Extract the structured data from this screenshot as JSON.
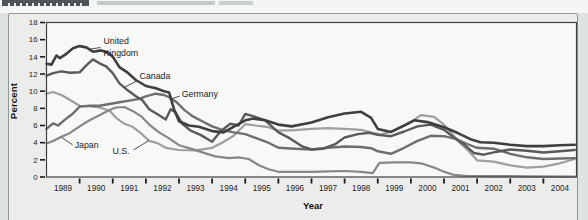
{
  "chart_data": {
    "type": "line",
    "xlabel": "Year",
    "ylabel": "Percent",
    "xlim": [
      1989,
      2005
    ],
    "ylim": [
      0,
      18
    ],
    "y_ticks": [
      0,
      2,
      4,
      6,
      8,
      10,
      12,
      14,
      16,
      18
    ],
    "x_tick_labels": [
      "1989",
      "1990",
      "1991",
      "1992",
      "1993",
      "1994",
      "1995",
      "1996",
      "1997",
      "1998",
      "1999",
      "2000",
      "2001",
      "2002",
      "2003",
      "2004"
    ],
    "grid": false,
    "legend": "inline-labels",
    "colors": {
      "frame": "#3f3f3f",
      "tick": "#1a1a1a",
      "text": "#1c1c1c",
      "plot_bg": "#f8f8f6",
      "leader": "#3c3c3c"
    },
    "series": [
      {
        "name": "U.S.",
        "color": "#9e9e9e",
        "width": 2.2,
        "points": [
          [
            1989.0,
            9.7
          ],
          [
            1989.2,
            9.9
          ],
          [
            1989.45,
            9.55
          ],
          [
            1989.7,
            9.0
          ],
          [
            1990.0,
            8.3
          ],
          [
            1990.3,
            8.25
          ],
          [
            1990.6,
            8.1
          ],
          [
            1990.9,
            7.75
          ],
          [
            1991.1,
            6.9
          ],
          [
            1991.35,
            6.2
          ],
          [
            1991.6,
            5.85
          ],
          [
            1991.85,
            5.1
          ],
          [
            1992.1,
            4.2
          ],
          [
            1992.35,
            3.95
          ],
          [
            1992.6,
            3.4
          ],
          [
            1993.0,
            3.15
          ],
          [
            1993.5,
            3.1
          ],
          [
            1994.0,
            3.4
          ],
          [
            1994.3,
            4.0
          ],
          [
            1994.65,
            4.8
          ],
          [
            1995.0,
            6.15
          ],
          [
            1995.3,
            6.0
          ],
          [
            1995.65,
            5.85
          ],
          [
            1996.0,
            5.4
          ],
          [
            1996.5,
            5.45
          ],
          [
            1997.0,
            5.6
          ],
          [
            1997.5,
            5.7
          ],
          [
            1998.0,
            5.6
          ],
          [
            1998.5,
            5.5
          ],
          [
            1998.85,
            5.15
          ],
          [
            1999.1,
            4.95
          ],
          [
            1999.5,
            5.4
          ],
          [
            2000.0,
            6.4
          ],
          [
            2000.3,
            7.2
          ],
          [
            2000.7,
            7.0
          ],
          [
            2001.0,
            6.1
          ],
          [
            2001.25,
            5.0
          ],
          [
            2001.5,
            3.9
          ],
          [
            2001.75,
            3.0
          ],
          [
            2002.0,
            1.95
          ],
          [
            2002.5,
            1.8
          ],
          [
            2003.0,
            1.35
          ],
          [
            2003.5,
            1.1
          ],
          [
            2004.0,
            1.2
          ],
          [
            2004.5,
            1.6
          ],
          [
            2004.95,
            2.1
          ]
        ]
      },
      {
        "name": "Japan",
        "color": "#878787",
        "width": 2.2,
        "points": [
          [
            1989.0,
            3.9
          ],
          [
            1989.2,
            4.2
          ],
          [
            1989.45,
            4.7
          ],
          [
            1989.7,
            5.1
          ],
          [
            1990.0,
            5.9
          ],
          [
            1990.3,
            6.6
          ],
          [
            1990.6,
            7.2
          ],
          [
            1990.9,
            7.8
          ],
          [
            1991.1,
            8.1
          ],
          [
            1991.35,
            8.15
          ],
          [
            1991.6,
            7.7
          ],
          [
            1991.85,
            7.1
          ],
          [
            1992.1,
            6.1
          ],
          [
            1992.4,
            5.2
          ],
          [
            1992.7,
            4.5
          ],
          [
            1993.0,
            3.7
          ],
          [
            1993.4,
            3.25
          ],
          [
            1993.8,
            2.75
          ],
          [
            1994.1,
            2.4
          ],
          [
            1994.5,
            2.2
          ],
          [
            1994.8,
            2.3
          ],
          [
            1995.1,
            2.1
          ],
          [
            1995.4,
            1.4
          ],
          [
            1995.7,
            0.9
          ],
          [
            1996.0,
            0.6
          ],
          [
            1996.5,
            0.6
          ],
          [
            1997.0,
            0.6
          ],
          [
            1997.5,
            0.65
          ],
          [
            1998.0,
            0.7
          ],
          [
            1998.5,
            0.6
          ],
          [
            1998.85,
            0.45
          ],
          [
            1999.05,
            1.65
          ],
          [
            1999.5,
            1.7
          ],
          [
            2000.0,
            1.7
          ],
          [
            2000.35,
            1.55
          ],
          [
            2000.7,
            1.1
          ],
          [
            2001.0,
            0.6
          ],
          [
            2001.3,
            0.25
          ],
          [
            2001.7,
            0.12
          ],
          [
            2002.5,
            0.1
          ],
          [
            2003.5,
            0.08
          ],
          [
            2004.95,
            0.05
          ]
        ]
      },
      {
        "name": "Germany",
        "color": "#6e6e6e",
        "width": 2.4,
        "points": [
          [
            1989.0,
            5.6
          ],
          [
            1989.2,
            6.25
          ],
          [
            1989.35,
            6.0
          ],
          [
            1989.55,
            6.65
          ],
          [
            1989.8,
            7.4
          ],
          [
            1990.0,
            8.2
          ],
          [
            1990.3,
            8.3
          ],
          [
            1990.6,
            8.3
          ],
          [
            1990.9,
            8.5
          ],
          [
            1991.2,
            8.7
          ],
          [
            1991.5,
            8.9
          ],
          [
            1991.8,
            9.1
          ],
          [
            1992.0,
            9.4
          ],
          [
            1992.3,
            9.7
          ],
          [
            1992.55,
            9.55
          ],
          [
            1992.75,
            9.2
          ],
          [
            1992.95,
            8.65
          ],
          [
            1993.15,
            7.85
          ],
          [
            1993.4,
            7.1
          ],
          [
            1993.7,
            6.5
          ],
          [
            1994.0,
            5.9
          ],
          [
            1994.3,
            5.5
          ],
          [
            1994.65,
            5.2
          ],
          [
            1995.0,
            5.0
          ],
          [
            1995.35,
            4.5
          ],
          [
            1995.7,
            4.0
          ],
          [
            1996.0,
            3.4
          ],
          [
            1996.5,
            3.3
          ],
          [
            1997.0,
            3.2
          ],
          [
            1997.5,
            3.4
          ],
          [
            1998.0,
            3.55
          ],
          [
            1998.5,
            3.5
          ],
          [
            1998.8,
            3.35
          ],
          [
            1999.0,
            3.0
          ],
          [
            1999.4,
            2.7
          ],
          [
            1999.8,
            3.4
          ],
          [
            2000.2,
            4.2
          ],
          [
            2000.6,
            4.8
          ],
          [
            2001.0,
            4.75
          ],
          [
            2001.35,
            4.45
          ],
          [
            2001.7,
            3.85
          ],
          [
            2002.0,
            3.4
          ],
          [
            2002.5,
            3.3
          ],
          [
            2003.0,
            2.7
          ],
          [
            2003.5,
            2.3
          ],
          [
            2004.0,
            2.1
          ],
          [
            2004.5,
            2.15
          ],
          [
            2004.95,
            2.2
          ]
        ]
      },
      {
        "name": "Canada",
        "color": "#5a5a5a",
        "width": 2.4,
        "points": [
          [
            1989.0,
            11.8
          ],
          [
            1989.2,
            12.1
          ],
          [
            1989.45,
            12.3
          ],
          [
            1989.7,
            12.15
          ],
          [
            1990.0,
            12.2
          ],
          [
            1990.2,
            13.0
          ],
          [
            1990.4,
            13.7
          ],
          [
            1990.6,
            13.25
          ],
          [
            1990.8,
            12.9
          ],
          [
            1991.0,
            12.1
          ],
          [
            1991.2,
            10.9
          ],
          [
            1991.45,
            10.1
          ],
          [
            1991.7,
            9.4
          ],
          [
            1991.9,
            8.9
          ],
          [
            1992.1,
            7.9
          ],
          [
            1992.35,
            7.3
          ],
          [
            1992.6,
            6.7
          ],
          [
            1992.75,
            7.9
          ],
          [
            1992.9,
            7.5
          ],
          [
            1993.1,
            6.2
          ],
          [
            1993.35,
            5.4
          ],
          [
            1993.65,
            4.9
          ],
          [
            1994.0,
            4.1
          ],
          [
            1994.25,
            5.3
          ],
          [
            1994.55,
            6.2
          ],
          [
            1994.8,
            6.0
          ],
          [
            1995.0,
            7.35
          ],
          [
            1995.3,
            7.0
          ],
          [
            1995.6,
            6.6
          ],
          [
            1996.0,
            5.2
          ],
          [
            1996.35,
            4.5
          ],
          [
            1996.7,
            3.6
          ],
          [
            1997.0,
            3.2
          ],
          [
            1997.35,
            3.3
          ],
          [
            1997.7,
            3.8
          ],
          [
            1998.0,
            4.6
          ],
          [
            1998.4,
            5.0
          ],
          [
            1998.75,
            5.15
          ],
          [
            1999.0,
            4.9
          ],
          [
            1999.4,
            4.75
          ],
          [
            1999.8,
            5.3
          ],
          [
            2000.2,
            5.9
          ],
          [
            2000.6,
            6.1
          ],
          [
            2001.0,
            5.5
          ],
          [
            2001.3,
            4.6
          ],
          [
            2001.6,
            3.8
          ],
          [
            2001.9,
            2.8
          ],
          [
            2002.2,
            2.6
          ],
          [
            2002.6,
            2.95
          ],
          [
            2003.0,
            3.2
          ],
          [
            2003.5,
            3.05
          ],
          [
            2004.0,
            2.85
          ],
          [
            2004.5,
            3.0
          ],
          [
            2004.95,
            3.15
          ]
        ]
      },
      {
        "name": "United Kingdom",
        "color": "#3f3f3f",
        "width": 2.6,
        "points": [
          [
            1989.0,
            13.2
          ],
          [
            1989.15,
            13.1
          ],
          [
            1989.3,
            14.15
          ],
          [
            1989.4,
            13.85
          ],
          [
            1989.6,
            14.35
          ],
          [
            1989.8,
            15.0
          ],
          [
            1990.0,
            15.25
          ],
          [
            1990.2,
            15.1
          ],
          [
            1990.4,
            14.6
          ],
          [
            1990.65,
            14.75
          ],
          [
            1990.85,
            14.5
          ],
          [
            1991.0,
            14.0
          ],
          [
            1991.2,
            12.8
          ],
          [
            1991.45,
            12.15
          ],
          [
            1991.7,
            11.3
          ],
          [
            1992.0,
            10.6
          ],
          [
            1992.3,
            10.35
          ],
          [
            1992.55,
            10.0
          ],
          [
            1992.7,
            9.85
          ],
          [
            1992.85,
            7.9
          ],
          [
            1993.0,
            6.5
          ],
          [
            1993.3,
            6.0
          ],
          [
            1993.6,
            5.85
          ],
          [
            1994.0,
            5.35
          ],
          [
            1994.35,
            5.2
          ],
          [
            1994.7,
            5.95
          ],
          [
            1995.0,
            6.6
          ],
          [
            1995.25,
            6.8
          ],
          [
            1995.6,
            6.6
          ],
          [
            1996.0,
            6.1
          ],
          [
            1996.4,
            5.9
          ],
          [
            1997.0,
            6.35
          ],
          [
            1997.5,
            6.95
          ],
          [
            1998.0,
            7.4
          ],
          [
            1998.5,
            7.6
          ],
          [
            1998.8,
            6.9
          ],
          [
            1999.0,
            5.6
          ],
          [
            1999.4,
            5.25
          ],
          [
            1999.8,
            6.0
          ],
          [
            2000.1,
            6.6
          ],
          [
            2000.5,
            6.4
          ],
          [
            2001.0,
            5.8
          ],
          [
            2001.4,
            5.15
          ],
          [
            2001.8,
            4.4
          ],
          [
            2002.1,
            4.05
          ],
          [
            2002.5,
            4.0
          ],
          [
            2003.0,
            3.75
          ],
          [
            2003.5,
            3.6
          ],
          [
            2004.0,
            3.6
          ],
          [
            2004.5,
            3.7
          ],
          [
            2004.95,
            3.75
          ]
        ]
      }
    ],
    "labels": [
      {
        "series": "United Kingdom",
        "lines": [
          "United",
          "Kingdom"
        ],
        "x": 1990.72,
        "y": 15.45,
        "leader": [
          1990.63,
          15.09,
          1990.25,
          14.85
        ]
      },
      {
        "series": "Canada",
        "lines": [
          "Canada"
        ],
        "x": 1991.81,
        "y": 11.46,
        "leader": [
          1991.75,
          11.23,
          1991.33,
          10.41
        ]
      },
      {
        "series": "Germany",
        "lines": [
          "Germany"
        ],
        "x": 1993.08,
        "y": 9.36,
        "leader": [
          1993.02,
          9.42,
          1992.72,
          9.05
        ]
      },
      {
        "series": "Japan",
        "lines": [
          "Japan"
        ],
        "x": 1989.85,
        "y": 3.39,
        "leader": [
          1989.79,
          3.74,
          1989.45,
          4.62
        ]
      },
      {
        "series": "U.S.",
        "lines": [
          "U.S."
        ],
        "x": 1990.99,
        "y": 2.69,
        "leader": [
          1991.63,
          3.16,
          1992.09,
          4.25
        ]
      }
    ]
  }
}
